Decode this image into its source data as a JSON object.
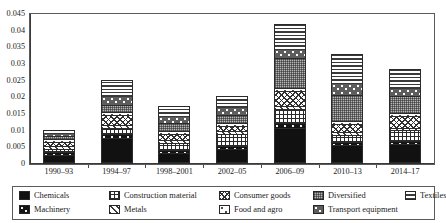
{
  "chart_data": {
    "type": "bar",
    "stacked": true,
    "title": "",
    "xlabel": "",
    "ylabel": "Negative ICAE",
    "ylim": [
      0,
      0.045
    ],
    "ytick_step": 0.005,
    "ytick_labels": [
      "0",
      "0.005",
      "0.01",
      "0.015",
      "0.02",
      "0.025",
      "0.03",
      "0.035",
      "0.04",
      "0.045"
    ],
    "ytick_values": [
      0,
      0.005,
      0.01,
      0.015,
      0.02,
      0.025,
      0.03,
      0.035,
      0.04,
      0.045
    ],
    "grid": false,
    "legend_position": "bottom",
    "categories": [
      "1990–93",
      "1994–97",
      "1998–2001",
      "2002–05",
      "2006–09",
      "2010–13",
      "2014–17"
    ],
    "series": [
      {
        "name": "Chemicals",
        "pattern": "p-chemicals",
        "values": [
          0.002,
          0.0072,
          0.0028,
          0.0038,
          0.0103,
          0.0051,
          0.0055
        ]
      },
      {
        "name": "Machinery",
        "pattern": "p-machinery",
        "values": [
          0.0009,
          0.0011,
          0.0009,
          0.001,
          0.0013,
          0.001,
          0.0009
        ]
      },
      {
        "name": "Construction material",
        "pattern": "p-construction",
        "values": [
          0.0011,
          0.002,
          0.0021,
          0.0036,
          0.0043,
          0.0021,
          0.0031
        ]
      },
      {
        "name": "Metals",
        "pattern": "p-metals",
        "values": [
          0.0008,
          0.0008,
          0.0008,
          0.0009,
          0.001,
          0.0009,
          0.0008
        ]
      },
      {
        "name": "Consumer goods",
        "pattern": "p-consumer",
        "values": [
          0.0013,
          0.003,
          0.0019,
          0.0015,
          0.0043,
          0.0022,
          0.0035
        ]
      },
      {
        "name": "Food and agro",
        "pattern": "p-food",
        "values": [
          0.0007,
          0.0009,
          0.0008,
          0.0008,
          0.001,
          0.0009,
          0.0008
        ]
      },
      {
        "name": "Diversified",
        "pattern": "p-diversified",
        "values": [
          0.0011,
          0.0022,
          0.0024,
          0.0026,
          0.0089,
          0.0078,
          0.0051
        ]
      },
      {
        "name": "Transport equipment",
        "pattern": "p-transport",
        "values": [
          0.0007,
          0.0025,
          0.0022,
          0.0024,
          0.0028,
          0.0038,
          0.0025
        ]
      },
      {
        "name": "Textiles",
        "pattern": "p-textiles",
        "values": [
          0.0009,
          0.0048,
          0.0028,
          0.0031,
          0.0076,
          0.0086,
          0.0056
        ]
      }
    ],
    "totals": [
      0.0095,
      0.0245,
      0.0167,
      0.0197,
      0.0415,
      0.0324,
      0.0278
    ]
  },
  "legend": {
    "items": [
      {
        "label": "Chemicals",
        "pattern": "p-chemicals"
      },
      {
        "label": "Construction material",
        "pattern": "p-construction"
      },
      {
        "label": "Consumer goods",
        "pattern": "p-consumer"
      },
      {
        "label": "Diversified",
        "pattern": "p-diversified"
      },
      {
        "label": "Textiles",
        "pattern": "p-textiles"
      },
      {
        "label": "Machinery",
        "pattern": "p-machinery"
      },
      {
        "label": "Metals",
        "pattern": "p-metals"
      },
      {
        "label": "Food and agro",
        "pattern": "p-food"
      },
      {
        "label": "Transport equipment",
        "pattern": "p-transport"
      }
    ]
  },
  "colors": {
    "axis": "#3a3a3a",
    "frame": "#5a5a5a",
    "text": "#1a1a1a"
  }
}
